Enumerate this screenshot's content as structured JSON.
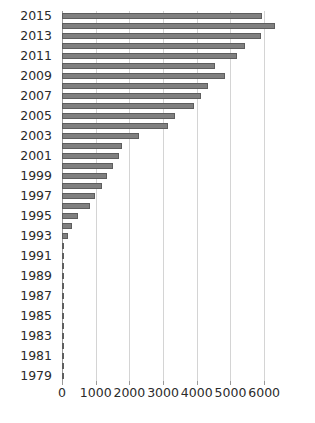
{
  "chart_data": {
    "type": "bar",
    "orientation": "horizontal",
    "title": "",
    "subtitle": "",
    "xlabel": "",
    "ylabel": "",
    "grid": true,
    "legend": null,
    "legend_position": "none",
    "xlim": [
      0,
      6500
    ],
    "xticks": [
      0,
      1000,
      2000,
      3000,
      4000,
      5000,
      6000
    ],
    "xtick_labels": [
      "0",
      "1000",
      "2000",
      "3000",
      "4000",
      "5000",
      "6000"
    ],
    "ytick_labels": [
      "2015",
      "2013",
      "2011",
      "2009",
      "2007",
      "2005",
      "2003",
      "2001",
      "1999",
      "1997",
      "1995",
      "1993",
      "1991",
      "1989",
      "1987",
      "1985",
      "1983",
      "1981",
      "1979"
    ],
    "bar_color": "#808080",
    "bar_edge_color": "#5e5e5e",
    "grid_color": "#d4d4d4",
    "axis_color": "#9a9a9a",
    "categories": [
      "2015",
      "2014",
      "2013",
      "2012",
      "2011",
      "2010",
      "2009",
      "2008",
      "2007",
      "2006",
      "2005",
      "2004",
      "2003",
      "2002",
      "2001",
      "2000",
      "1999",
      "1998",
      "1997",
      "1996",
      "1995",
      "1994",
      "1993",
      "1992",
      "1991",
      "1990",
      "1989",
      "1988",
      "1987",
      "1986",
      "1985",
      "1984",
      "1983",
      "1982",
      "1981",
      "1980",
      "1979"
    ],
    "values": [
      5930,
      6330,
      5920,
      5420,
      5180,
      4540,
      4830,
      4340,
      4130,
      3920,
      3360,
      3150,
      2300,
      1790,
      1700,
      1500,
      1330,
      1190,
      970,
      830,
      480,
      300,
      170,
      70,
      50,
      30,
      20,
      15,
      12,
      10,
      8,
      6,
      5,
      4,
      3,
      2,
      1
    ]
  }
}
